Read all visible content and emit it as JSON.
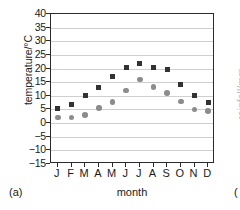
{
  "figure": {
    "panel_tag": "(a)",
    "adjacent_panel_tag": "(",
    "adjacent_panel_ylabel": "rainfall/mm"
  },
  "colors": {
    "max_series": "#333333",
    "min_series": "#8c8c8c",
    "axis": "#2b2b2b",
    "gridline": "#cfcfcf",
    "background": "#ffffff"
  },
  "chart_data": {
    "type": "scatter",
    "title": "",
    "xlabel": "month",
    "ylabel": "temperature/°C",
    "categories": [
      "J",
      "F",
      "M",
      "A",
      "M",
      "J",
      "J",
      "A",
      "S",
      "O",
      "N",
      "D"
    ],
    "ylim": [
      -15,
      40
    ],
    "yticks": [
      -15,
      -10,
      -5,
      0,
      5,
      10,
      15,
      20,
      25,
      30,
      35,
      40
    ],
    "ytick_labels": [
      "−15",
      "−10",
      "−5",
      "0",
      "5",
      "10",
      "15",
      "20",
      "25",
      "30",
      "35",
      "40"
    ],
    "grid": true,
    "legend": "none",
    "series": [
      {
        "name": "maximum temperature",
        "marker": "square",
        "color": "#333333",
        "values": [
          5.5,
          7.0,
          10.0,
          13.0,
          17.0,
          20.3,
          22.0,
          20.5,
          19.5,
          14.2,
          10.3,
          7.5
        ]
      },
      {
        "name": "minimum temperature",
        "marker": "circle",
        "color": "#8c8c8c",
        "values": [
          2.0,
          2.0,
          3.0,
          5.5,
          7.8,
          12.0,
          16.0,
          13.3,
          11.0,
          8.0,
          5.0,
          4.5
        ]
      }
    ]
  }
}
